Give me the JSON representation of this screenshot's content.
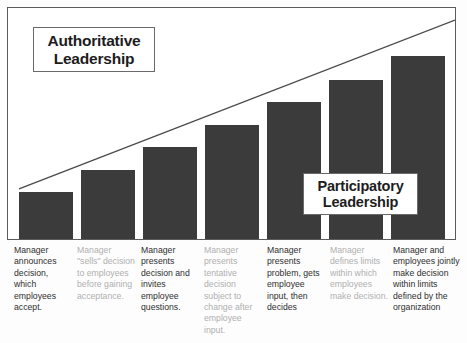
{
  "chart_data": {
    "type": "bar",
    "xlabel": "",
    "ylabel": "",
    "grid": false,
    "legend": "none",
    "ylim": [
      0,
      100
    ],
    "categories": [
      "Manager announces decision, which employees accept.",
      "Manager \"sells\" decision to employees before gaining acceptance.",
      "Manager presents decision and invites employee questions.",
      "Manager presents tentative decision subject to change after employee input.",
      "Manager presents problem, gets employee input, then decides",
      "Manager defines limits within which employees make decision.",
      "Manager and employees jointly make decision within limits defined by the organization"
    ],
    "values": [
      21,
      30,
      40,
      49,
      59,
      69,
      79
    ],
    "annotations": [
      "Authoritative Leadership",
      "Participatory Leadership"
    ]
  },
  "callouts": {
    "authoritative": {
      "line1": "Authoritative",
      "line2": "Leadership"
    },
    "participatory": {
      "line1": "Participatory",
      "line2": "Leadership"
    }
  },
  "captions": [
    {
      "text": "Manager announces decision, which employees accept."
    },
    {
      "text": "Manager \"sells\" decision to employees before gaining acceptance."
    },
    {
      "text": "Manager presents decision and invites employee questions."
    },
    {
      "text": "Manager presents tentative decision subject to change after employee input."
    },
    {
      "text": "Manager presents problem, gets employee input, then decides"
    },
    {
      "text": "Manager defines limits within which employees make decision."
    },
    {
      "text": "Manager and employees jointly make decision within limits defined by the organization"
    }
  ],
  "colors": {
    "bar_fill": "#3b3b3b",
    "frame_stroke": "#5b5b5b",
    "trend_line": "#4a4a4a",
    "caption_text": "#2f2f2f",
    "caption_text_faded": "#b0b0b0",
    "background": "#fdfdfd"
  },
  "geometry": {
    "bars": [
      {
        "left": 11,
        "width": 54,
        "top": 183
      },
      {
        "left": 73,
        "width": 54,
        "top": 161
      },
      {
        "left": 135,
        "width": 54,
        "top": 138
      },
      {
        "left": 197,
        "width": 54,
        "top": 116
      },
      {
        "left": 259,
        "width": 54,
        "top": 93
      },
      {
        "left": 321,
        "width": 54,
        "top": 71
      },
      {
        "left": 383,
        "width": 54,
        "top": 47
      }
    ],
    "trend": {
      "x1": 11,
      "y1": 180,
      "x2": 446,
      "y2": 12
    },
    "captions": [
      {
        "left": 14,
        "width": 58
      },
      {
        "left": 77,
        "width": 60
      },
      {
        "left": 141,
        "width": 58
      },
      {
        "left": 204,
        "width": 58
      },
      {
        "left": 267,
        "width": 58
      },
      {
        "left": 330,
        "width": 60
      },
      {
        "left": 393,
        "width": 70
      }
    ]
  }
}
